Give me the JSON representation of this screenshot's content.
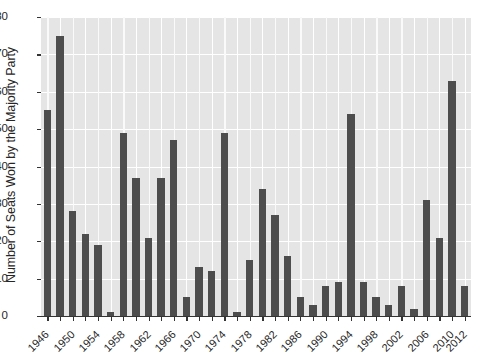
{
  "chart_data": {
    "type": "bar",
    "title": "",
    "xlabel": "",
    "ylabel": "Number of Seats Won by the Majority Party",
    "ylim": [
      0,
      80
    ],
    "yticks": [
      0,
      10,
      20,
      30,
      40,
      50,
      60,
      70,
      80
    ],
    "ytick_labels": [
      "0",
      "10",
      "20",
      "30",
      "40",
      "50",
      "60",
      "70",
      "80"
    ],
    "grid": true,
    "legend": "none",
    "bar_color": "#4d4d4d",
    "plot_background": "#e5e5e5",
    "categories": [
      "1946",
      "1948",
      "1950",
      "1952",
      "1954",
      "1956",
      "1958",
      "1960",
      "1962",
      "1964",
      "1966",
      "1968",
      "1970",
      "1972",
      "1974",
      "1976",
      "1978",
      "1980",
      "1982",
      "1984",
      "1986",
      "1988",
      "1990",
      "1992",
      "1994",
      "1996",
      "1998",
      "2000",
      "2002",
      "2004",
      "2006",
      "2008",
      "2010",
      "2012"
    ],
    "xtick_labels": [
      "1946",
      "1950",
      "1954",
      "1958",
      "1962",
      "1966",
      "1970",
      "1974",
      "1978",
      "1982",
      "1986",
      "1990",
      "1994",
      "1998",
      "2002",
      "2006",
      "2010",
      "2012"
    ],
    "values": [
      55,
      75,
      28,
      22,
      19,
      1,
      49,
      37,
      21,
      37,
      47,
      5,
      13,
      12,
      49,
      1,
      15,
      34,
      27,
      16,
      5,
      3,
      8,
      9,
      54,
      9,
      5,
      3,
      8,
      2,
      31,
      21,
      63,
      8
    ]
  }
}
